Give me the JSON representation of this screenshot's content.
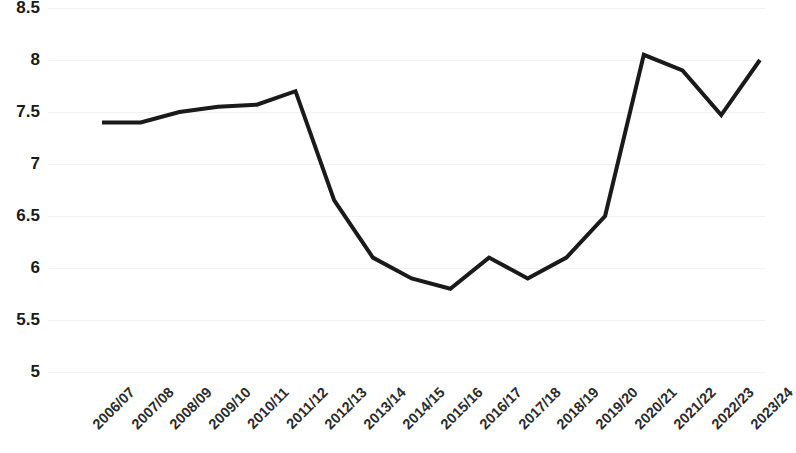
{
  "chart_data": {
    "type": "line",
    "title": "",
    "subtitle": "",
    "xlabel": "",
    "ylabel": "",
    "categories": [
      "2006/07",
      "2007/08",
      "2008/09",
      "2009/10",
      "2010/11",
      "2011/12",
      "2012/13",
      "2013/14",
      "2014/15",
      "2015/16",
      "2016/17",
      "2017/18",
      "2018/19",
      "2019/20",
      "2020/21",
      "2021/22",
      "2022/23",
      "2023/24"
    ],
    "values": [
      7.4,
      7.4,
      7.5,
      7.55,
      7.57,
      7.7,
      6.65,
      6.1,
      5.9,
      5.8,
      6.1,
      5.9,
      6.1,
      6.5,
      8.05,
      7.9,
      7.47,
      8.0
    ],
    "series": [
      {
        "name": "",
        "values": [
          7.4,
          7.4,
          7.5,
          7.55,
          7.57,
          7.7,
          6.65,
          6.1,
          5.9,
          5.8,
          6.1,
          5.9,
          6.1,
          6.5,
          8.05,
          7.9,
          7.47,
          8.0
        ]
      }
    ],
    "ylim": [
      5,
      8.5
    ],
    "ytick_values": [
      8.5,
      8,
      7.5,
      7,
      6.5,
      6,
      5.5,
      5
    ],
    "ytick_labels": [
      "8.5",
      "8",
      "7.5",
      "7",
      "6.5",
      "6",
      "5.5",
      "5"
    ],
    "grid": true,
    "grid_color": "#f2f2f2",
    "legend": false,
    "legend_position": "none",
    "line_color": "#1a1a1a",
    "line_width": 4,
    "markers": false,
    "annotations": []
  }
}
